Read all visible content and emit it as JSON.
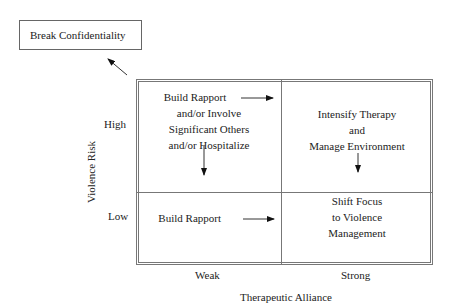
{
  "outside_box": {
    "label": "Break Confidentiality"
  },
  "quadrants": {
    "high_weak": {
      "lines": [
        "Build Rapport",
        "and/or Involve",
        "Significant Others",
        "and/or Hospitalize"
      ]
    },
    "high_strong": {
      "lines": [
        "Intensify Therapy",
        "and",
        "Manage Environment"
      ]
    },
    "low_weak": {
      "lines": [
        "Build Rapport"
      ]
    },
    "low_strong": {
      "lines": [
        "Shift Focus",
        "to Violence",
        "Management"
      ]
    }
  },
  "y_axis": {
    "title": "Violence Risk",
    "ticks": [
      "High",
      "Low"
    ]
  },
  "x_axis": {
    "title": "Therapeutic Alliance",
    "ticks": [
      "Weak",
      "Strong"
    ]
  },
  "colors": {
    "line": "#777777",
    "text": "#222222",
    "arrow": "#111111"
  }
}
